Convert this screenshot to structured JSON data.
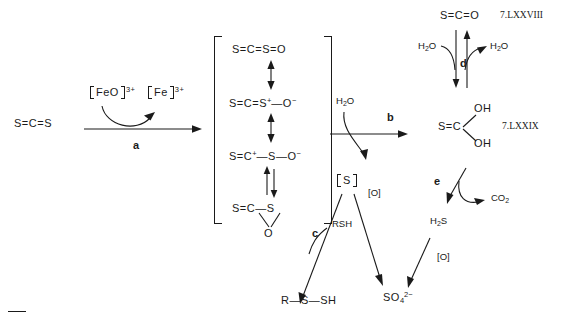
{
  "scheme": {
    "title": "Metabolic scheme of carbon disulfide biotransformation",
    "substrate": {
      "name": "carbon disulfide",
      "formula_html": "S=C=S"
    },
    "step_a": {
      "label": "a",
      "cofactor_in": "FeO",
      "cofactor_in_charge": "3+",
      "cofactor_out": "Fe",
      "cofactor_out_charge": "3+"
    },
    "resonance_bracket": {
      "structures": [
        {
          "id": "res-1",
          "formula_html": "S=C=S=O"
        },
        {
          "id": "res-2",
          "formula_html": "S=C=S(+)-O(-)"
        },
        {
          "id": "res-3",
          "formula_html": "S=C(+)-S-O(-)"
        },
        {
          "id": "res-4",
          "formula_html": "S=C-S epoxide ring with O"
        }
      ],
      "ring_atoms": {
        "left": "S",
        "center": "C",
        "right": "S",
        "bridge": "O"
      }
    },
    "step_b": {
      "label": "b",
      "reactant": "H2O",
      "product_bracket": "S"
    },
    "step_c": {
      "label": "c",
      "reactant": "RSH",
      "product": "R-S-SH"
    },
    "oxidation_left": {
      "label": "[O]",
      "product": "SO4 2-"
    },
    "step_d": {
      "label": "d",
      "reactant": "H2O",
      "product": "H2O"
    },
    "step_e": {
      "label": "e",
      "product_side": "CO2",
      "product_main": "H2S"
    },
    "oxidation_right": {
      "label": "[O]"
    },
    "cos": {
      "formula_html": "S=C=O",
      "compound_id": "7.LXXVIII"
    },
    "thiocarbonic_acid": {
      "core": "S=C",
      "oh_top": "OH",
      "oh_bottom": "OH",
      "compound_id": "7.LXXIX"
    },
    "labels": {
      "water": "H2O",
      "hydrogen_sulfide": "H2S",
      "carbon_dioxide": "CO2",
      "sulfate": "SO4",
      "sulfate_charge": "2-",
      "thiol": "RSH",
      "perthiol": "R-S-SH",
      "oxidant": "[O]",
      "sulfur_atom": "S"
    }
  },
  "colors": {
    "ink": "#1a1a1a",
    "background": "#ffffff"
  }
}
